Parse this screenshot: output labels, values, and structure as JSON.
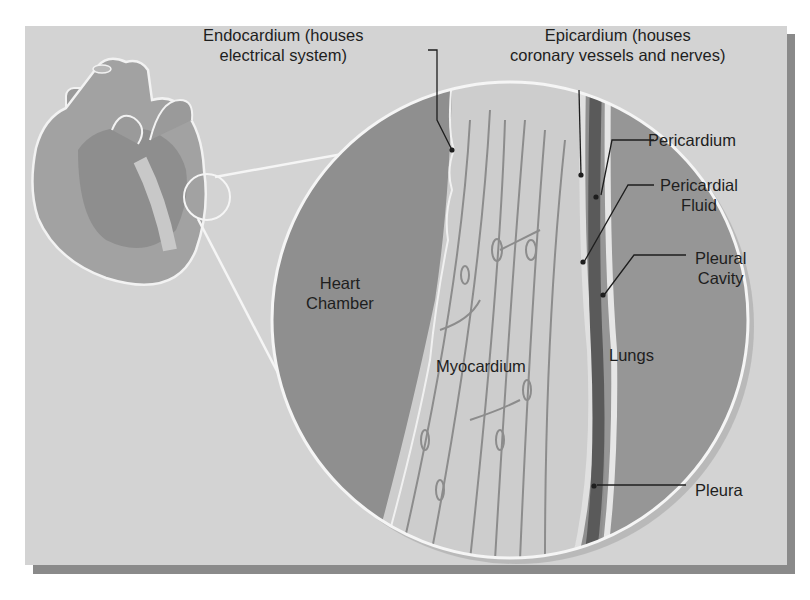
{
  "figure": {
    "colors": {
      "panel_bg": "#d3d3d3",
      "shadow": "#8a8a8a",
      "heart_chamber": "#8f8f8f",
      "myocardium": "#cdcdcd",
      "myocardium_fiber": "#8c8c8c",
      "pericardium": "#5a5a5a",
      "lungs": "#979797",
      "outline": "#f5f5f5",
      "leader_line": "#1e1e1e"
    },
    "labels": {
      "endocardium_line1": "Endocardium (houses",
      "endocardium_line2": "electrical system)",
      "epicardium_line1": "Epicardium (houses",
      "epicardium_line2": "coronary vessels and nerves)",
      "pericardium": "Pericardium",
      "pericardial_fluid_line1": "Pericardial",
      "pericardial_fluid_line2": "Fluid",
      "pleural_cavity_line1": "Pleural",
      "pleural_cavity_line2": "Cavity",
      "heart_chamber_line1": "Heart",
      "heart_chamber_line2": "Chamber",
      "myocardium": "Myocardium",
      "lungs": "Lungs",
      "pleura": "Pleura"
    }
  }
}
